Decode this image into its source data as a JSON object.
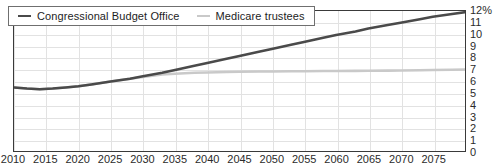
{
  "chart_data": {
    "type": "line",
    "title": "",
    "subtitle": "",
    "xlabel": "",
    "ylabel": "",
    "xlim": [
      2010,
      2080
    ],
    "ylim": [
      0,
      12
    ],
    "grid": true,
    "legend_position": "top-left",
    "y_tick_labels": [
      "12%",
      "11",
      "10",
      "9",
      "8",
      "7",
      "6",
      "5",
      "4",
      "3",
      "2",
      "1",
      "0"
    ],
    "y_tick_values": [
      12,
      11,
      10,
      9,
      8,
      7,
      6,
      5,
      4,
      3,
      2,
      1,
      0
    ],
    "x_tick_labels": [
      "2010",
      "2015",
      "2020",
      "2025",
      "2030",
      "2035",
      "2040",
      "2045",
      "2050",
      "2055",
      "2060",
      "2065",
      "2070",
      "2075"
    ],
    "x_tick_values": [
      2010,
      2015,
      2020,
      2025,
      2030,
      2035,
      2040,
      2045,
      2050,
      2055,
      2060,
      2065,
      2070,
      2075
    ],
    "series": [
      {
        "name": "Congressional Budget Office",
        "color": "#4a4a4a",
        "width": 2.6,
        "x": [
          2010,
          2012,
          2014,
          2016,
          2018,
          2020,
          2022,
          2025,
          2028,
          2030,
          2033,
          2035,
          2038,
          2040,
          2043,
          2045,
          2048,
          2050,
          2053,
          2055,
          2058,
          2060,
          2063,
          2065,
          2068,
          2070,
          2073,
          2075,
          2078,
          2080
        ],
        "values": [
          5.45,
          5.35,
          5.3,
          5.35,
          5.45,
          5.55,
          5.7,
          5.95,
          6.2,
          6.4,
          6.7,
          6.95,
          7.3,
          7.55,
          7.9,
          8.15,
          8.5,
          8.75,
          9.1,
          9.35,
          9.7,
          9.95,
          10.25,
          10.5,
          10.8,
          11.0,
          11.3,
          11.5,
          11.75,
          11.9
        ]
      },
      {
        "name": "Medicare trustees",
        "color": "#c9c9c9",
        "width": 2.6,
        "x": [
          2010,
          2012,
          2014,
          2016,
          2018,
          2020,
          2022,
          2025,
          2028,
          2030,
          2033,
          2035,
          2038,
          2040,
          2043,
          2045,
          2048,
          2050,
          2053,
          2055,
          2058,
          2060,
          2063,
          2065,
          2068,
          2070,
          2073,
          2075,
          2078,
          2080
        ],
        "values": [
          5.45,
          5.35,
          5.3,
          5.35,
          5.45,
          5.55,
          5.7,
          5.95,
          6.2,
          6.35,
          6.55,
          6.62,
          6.7,
          6.73,
          6.77,
          6.79,
          6.81,
          6.82,
          6.83,
          6.84,
          6.85,
          6.86,
          6.87,
          6.88,
          6.89,
          6.9,
          6.92,
          6.94,
          6.96,
          6.98
        ]
      }
    ]
  },
  "legend": {
    "items": [
      {
        "label": "Congressional Budget Office",
        "color": "#4a4a4a"
      },
      {
        "label": "Medicare trustees",
        "color": "#c9c9c9"
      }
    ]
  }
}
